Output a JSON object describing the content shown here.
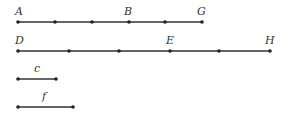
{
  "diagram": {
    "type": "line-segments",
    "color": "#333333",
    "segments": [
      {
        "name": "AG",
        "labels": {
          "A": "A",
          "B": "B",
          "G": "G"
        }
      },
      {
        "name": "DH",
        "labels": {
          "D": "D",
          "E": "E",
          "H": "H"
        }
      },
      {
        "name": "c",
        "label": "c"
      },
      {
        "name": "f",
        "label": "f"
      }
    ]
  }
}
